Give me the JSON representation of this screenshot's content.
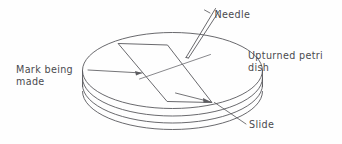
{
  "figure": {
    "background_color": "#fefefe",
    "ink_color": "#58585c",
    "width": 342,
    "height": 144
  },
  "labels": {
    "needle": "Needle",
    "upturned_petri_dish_line1": "Upturned petri",
    "upturned_petri_dish_line2": "dish",
    "mark_being_made_line1": "Mark being",
    "mark_being_made_line2": "made",
    "slide": "Slide"
  },
  "parts": {
    "dish": "upturned-petri-dish",
    "slide": "glass-slide",
    "needle": "needle",
    "mark": "mark-being-made"
  }
}
